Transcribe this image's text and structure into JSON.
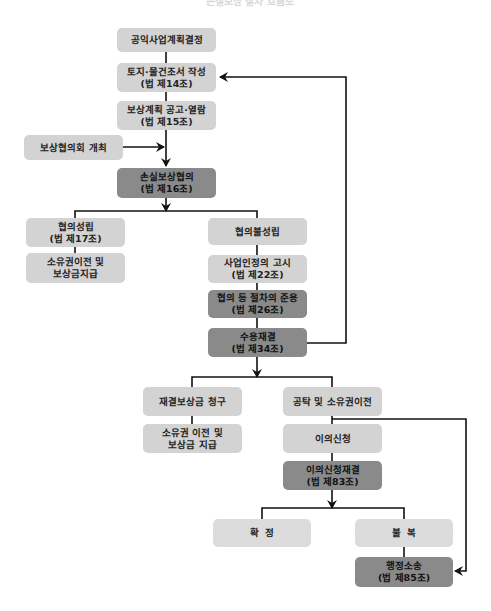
{
  "title": "손실보상 절차 흐름도",
  "nodes": {
    "n1": {
      "line1": "공익사업계획결정",
      "line2": ""
    },
    "n2": {
      "line1": "토지·물건조서 작성",
      "line2": "(법 제14조)"
    },
    "n3": {
      "line1": "보상계획 공고·열람",
      "line2": "(법 제15조)"
    },
    "n4": {
      "line1": "보상협의회 개최",
      "line2": ""
    },
    "n5": {
      "line1": "손실보상협의",
      "line2": "(법 제16조)"
    },
    "n6": {
      "line1": "협의성립",
      "line2": "(법 제17조)"
    },
    "n7": {
      "line1": "소유권이전 및",
      "line2": "보상금지급"
    },
    "n8": {
      "line1": "협의불성립",
      "line2": ""
    },
    "n9": {
      "line1": "사업인정의 고시",
      "line2": "(법 제22조)"
    },
    "n10": {
      "line1": "협의 등 절차의 준용",
      "line2": "(법 제26조)"
    },
    "n11": {
      "line1": "수용재결",
      "line2": "(법 제34조)"
    },
    "n12": {
      "line1": "재결보상금 청구",
      "line2": ""
    },
    "n13": {
      "line1": "소유권 이전 및",
      "line2": "보상금 지급"
    },
    "n14": {
      "line1": "공탁 및 소유권이전",
      "line2": ""
    },
    "n15": {
      "line1": "이의신청",
      "line2": ""
    },
    "n16": {
      "line1": "이의신청재결",
      "line2": "(법 제83조)"
    },
    "n17": {
      "line1": "확  정",
      "line2": ""
    },
    "n18": {
      "line1": "불  복",
      "line2": ""
    },
    "n19": {
      "line1": "행정소송",
      "line2": "(법 제85조)"
    }
  },
  "colors": {
    "box_light": "#d3d3d3",
    "box_dark": "#8a8a8a",
    "line": "#111111"
  }
}
